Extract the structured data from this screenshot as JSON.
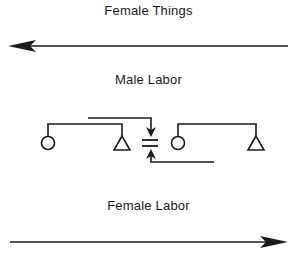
{
  "diagram": {
    "labels": {
      "top": "Female Things",
      "middle": "Male Labor",
      "bottom": "Female Labor"
    },
    "arrows": {
      "top": {
        "direction": "left",
        "meaning": "Female Things"
      },
      "bottom": {
        "direction": "right",
        "meaning": "Female Labor"
      }
    },
    "kinship_groups": [
      {
        "position": "left",
        "members": [
          "female-circle",
          "male-triangle"
        ]
      },
      {
        "position": "right",
        "members": [
          "female-circle",
          "male-triangle"
        ]
      }
    ],
    "exchange_symbol": "marriage-equals-sign",
    "colors": {
      "ink": "#1a1a1a",
      "background": "#ffffff"
    }
  }
}
